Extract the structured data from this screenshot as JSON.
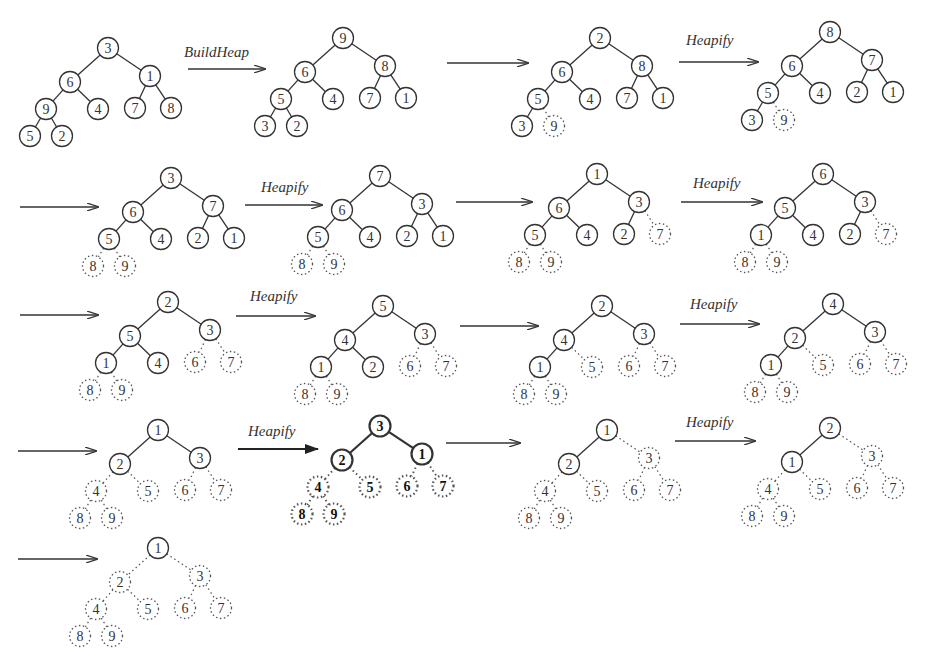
{
  "colors": {
    "stroke": "#333333",
    "background": "#ffffff",
    "removed": "#555555"
  },
  "layout": {
    "offsets": [
      [
        0,
        0
      ],
      [
        22,
        -38
      ],
      [
        -6,
        -38
      ],
      [
        -30,
        -60
      ],
      [
        -52,
        -68
      ],
      [
        -44,
        -78
      ],
      [
        -76,
        -76
      ],
      [
        -78,
        -86
      ]
    ],
    "comment_positions": "relative node coordinates for a 9-node complete binary tree"
  },
  "node_positions": [
    [
      108,
      48
    ],
    [
      70,
      82
    ],
    [
      150,
      76
    ],
    [
      46,
      109
    ],
    [
      98,
      109
    ],
    [
      135,
      108
    ],
    [
      171,
      108
    ],
    [
      30,
      136
    ],
    [
      62,
      136
    ]
  ],
  "arrows": [
    {
      "label": "BuildHeap",
      "x1": 188,
      "y1": 69,
      "x2": 265,
      "y2": 69,
      "lx": 184,
      "ly": 44
    },
    {
      "label": "",
      "x1": 447,
      "y1": 63,
      "x2": 528,
      "y2": 63
    },
    {
      "label": "Heapify",
      "x1": 679,
      "y1": 62,
      "x2": 758,
      "y2": 62,
      "lx": 686,
      "ly": 32
    },
    {
      "label": "",
      "x1": 20,
      "y1": 207,
      "x2": 98,
      "y2": 207
    },
    {
      "label": "Heapify",
      "x1": 245,
      "y1": 205,
      "x2": 322,
      "y2": 205,
      "lx": 261,
      "ly": 179
    },
    {
      "label": "",
      "x1": 456,
      "y1": 202,
      "x2": 532,
      "y2": 202
    },
    {
      "label": "Heapify",
      "x1": 681,
      "y1": 202,
      "x2": 762,
      "y2": 202,
      "lx": 693,
      "ly": 175
    },
    {
      "label": "",
      "x1": 20,
      "y1": 315,
      "x2": 98,
      "y2": 315
    },
    {
      "label": "Heapify",
      "x1": 236,
      "y1": 316,
      "x2": 315,
      "y2": 316,
      "lx": 250,
      "ly": 288
    },
    {
      "label": "",
      "x1": 460,
      "y1": 326,
      "x2": 538,
      "y2": 326
    },
    {
      "label": "Heapify",
      "x1": 680,
      "y1": 324,
      "x2": 759,
      "y2": 324,
      "lx": 690,
      "ly": 296
    },
    {
      "label": "",
      "x1": 18,
      "y1": 451,
      "x2": 96,
      "y2": 451
    },
    {
      "label": "Heapify",
      "x1": 238,
      "y1": 449,
      "x2": 318,
      "y2": 449,
      "lx": 248,
      "ly": 423,
      "bold": true
    },
    {
      "label": "",
      "x1": 446,
      "y1": 443,
      "x2": 520,
      "y2": 443
    },
    {
      "label": "Heapify",
      "x1": 675,
      "y1": 441,
      "x2": 755,
      "y2": 441,
      "lx": 686,
      "ly": 414
    },
    {
      "label": "",
      "x1": 18,
      "y1": 559,
      "x2": 97,
      "y2": 559
    }
  ],
  "trees": [
    {
      "name": "initial",
      "dx": 0,
      "dy": 0,
      "values": [
        3,
        6,
        1,
        9,
        4,
        7,
        8,
        5,
        2
      ],
      "heap_size": 9
    },
    {
      "name": "after-buildheap",
      "dx": 235,
      "dy": -10,
      "values": [
        9,
        6,
        8,
        5,
        4,
        7,
        1,
        3,
        2
      ],
      "heap_size": 9
    },
    {
      "name": "swap-1",
      "dx": 492,
      "dy": -10,
      "values": [
        2,
        6,
        8,
        5,
        4,
        7,
        1,
        3,
        9
      ],
      "heap_size": 8
    },
    {
      "name": "heapify-1",
      "dx": 722,
      "dy": -16,
      "values": [
        8,
        6,
        7,
        5,
        4,
        2,
        1,
        3,
        9
      ],
      "heap_size": 8
    },
    {
      "name": "swap-2",
      "dx": 63,
      "dy": 130,
      "values": [
        3,
        6,
        7,
        5,
        4,
        2,
        1,
        8,
        9
      ],
      "heap_size": 7
    },
    {
      "name": "heapify-2",
      "dx": 272,
      "dy": 128,
      "values": [
        7,
        6,
        3,
        5,
        4,
        2,
        1,
        8,
        9
      ],
      "heap_size": 7
    },
    {
      "name": "swap-3",
      "dx": 489,
      "dy": 126,
      "values": [
        1,
        6,
        3,
        5,
        4,
        2,
        7,
        8,
        9
      ],
      "heap_size": 6
    },
    {
      "name": "heapify-3",
      "dx": 715,
      "dy": 126,
      "values": [
        6,
        5,
        3,
        1,
        4,
        2,
        7,
        8,
        9
      ],
      "heap_size": 6
    },
    {
      "name": "swap-4",
      "dx": 60,
      "dy": 254,
      "values": [
        2,
        5,
        3,
        1,
        4,
        6,
        7,
        8,
        9
      ],
      "heap_size": 5
    },
    {
      "name": "heapify-4",
      "dx": 275,
      "dy": 258,
      "values": [
        5,
        4,
        3,
        1,
        2,
        6,
        7,
        8,
        9
      ],
      "heap_size": 5
    },
    {
      "name": "swap-5",
      "dx": 494,
      "dy": 258,
      "values": [
        2,
        4,
        3,
        1,
        5,
        6,
        7,
        8,
        9
      ],
      "heap_size": 4
    },
    {
      "name": "heapify-5",
      "dx": 725,
      "dy": 256,
      "values": [
        4,
        2,
        3,
        1,
        5,
        6,
        7,
        8,
        9
      ],
      "heap_size": 4
    },
    {
      "name": "swap-6",
      "dx": 50,
      "dy": 382,
      "values": [
        1,
        2,
        3,
        4,
        5,
        6,
        7,
        8,
        9
      ],
      "heap_size": 3
    },
    {
      "name": "heapify-6",
      "dx": 272,
      "dy": 378,
      "values": [
        3,
        2,
        1,
        4,
        5,
        6,
        7,
        8,
        9
      ],
      "heap_size": 3,
      "bold": true
    },
    {
      "name": "swap-7",
      "dx": 499,
      "dy": 382,
      "values": [
        1,
        2,
        3,
        4,
        5,
        6,
        7,
        8,
        9
      ],
      "heap_size": 2
    },
    {
      "name": "heapify-7",
      "dx": 722,
      "dy": 380,
      "values": [
        2,
        1,
        3,
        4,
        5,
        6,
        7,
        8,
        9
      ],
      "heap_size": 2
    },
    {
      "name": "final",
      "dx": 50,
      "dy": 500,
      "values": [
        1,
        2,
        3,
        4,
        5,
        6,
        7,
        8,
        9
      ],
      "heap_size": 1
    }
  ]
}
